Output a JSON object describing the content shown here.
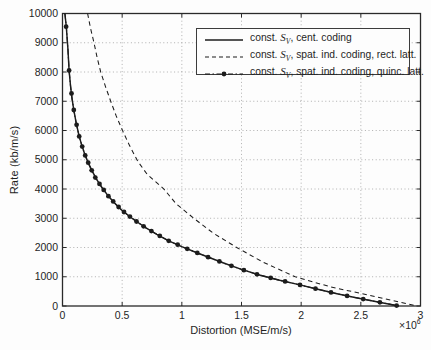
{
  "figure": {
    "background": "#fdfdfd",
    "axis_color": "#2a2a2a",
    "grid_color": "#9c9c9c",
    "text_color": "#1f1f1f",
    "ylabel": "Rate (kb/m/s)",
    "xlabel": "Distortion (MSE/m/s)",
    "x_exponent_prefix": "×10",
    "x_exponent_power": "6"
  },
  "chart_data": {
    "type": "line",
    "title": "",
    "xlabel": "Distortion (MSE/m/s)",
    "ylabel": "Rate (kb/m/s)",
    "xlim": [
      0,
      3
    ],
    "ylim": [
      0,
      10000
    ],
    "x_unit_multiplier": 1000000,
    "x_unit_label": "×10^6",
    "grid": true,
    "grid_style": "dotted",
    "legend_position": "upper-right-inside",
    "x_ticks": [
      0,
      0.5,
      1,
      1.5,
      2,
      2.5,
      3
    ],
    "x_tick_labels": [
      "0",
      "0.5",
      "1",
      "1.5",
      "2",
      "2.5",
      "3"
    ],
    "y_ticks": [
      0,
      1000,
      2000,
      3000,
      4000,
      5000,
      6000,
      7000,
      8000,
      9000,
      10000
    ],
    "y_tick_labels": [
      "0",
      "1000",
      "2000",
      "3000",
      "4000",
      "5000",
      "6000",
      "7000",
      "8000",
      "9000",
      "10000"
    ],
    "series": [
      {
        "name": "const. S_V, cent. coding",
        "line_style": "solid",
        "marker": "none",
        "color": "#1c1c1c",
        "points": [
          [
            0.02,
            10000
          ],
          [
            0.032,
            9550
          ],
          [
            0.045,
            8800
          ],
          [
            0.055,
            8050
          ],
          [
            0.068,
            7500
          ],
          [
            0.08,
            7100
          ],
          [
            0.095,
            6700
          ],
          [
            0.115,
            6250
          ],
          [
            0.14,
            5800
          ],
          [
            0.165,
            5450
          ],
          [
            0.19,
            5150
          ],
          [
            0.22,
            4850
          ],
          [
            0.25,
            4600
          ],
          [
            0.29,
            4300
          ],
          [
            0.33,
            4050
          ],
          [
            0.38,
            3780
          ],
          [
            0.43,
            3550
          ],
          [
            0.49,
            3300
          ],
          [
            0.55,
            3100
          ],
          [
            0.62,
            2890
          ],
          [
            0.7,
            2670
          ],
          [
            0.79,
            2450
          ],
          [
            0.89,
            2230
          ],
          [
            1.0,
            2030
          ],
          [
            1.12,
            1830
          ],
          [
            1.24,
            1640
          ],
          [
            1.35,
            1470
          ],
          [
            1.5,
            1250
          ],
          [
            1.65,
            1060
          ],
          [
            1.82,
            880
          ],
          [
            1.98,
            730
          ],
          [
            2.13,
            580
          ],
          [
            2.3,
            420
          ],
          [
            2.45,
            290
          ],
          [
            2.6,
            170
          ],
          [
            2.72,
            80
          ],
          [
            2.82,
            0
          ]
        ]
      },
      {
        "name": "const. S_V, spat. ind. coding, rect. latt.",
        "line_style": "dashed",
        "marker": "none",
        "color": "#1c1c1c",
        "points": [
          [
            0.21,
            10000
          ],
          [
            0.235,
            9500
          ],
          [
            0.264,
            9000
          ],
          [
            0.29,
            8500
          ],
          [
            0.32,
            8000
          ],
          [
            0.36,
            7500
          ],
          [
            0.404,
            7000
          ],
          [
            0.45,
            6500
          ],
          [
            0.503,
            6000
          ],
          [
            0.56,
            5500
          ],
          [
            0.63,
            4950
          ],
          [
            0.71,
            4500
          ],
          [
            0.85,
            4000
          ],
          [
            0.95,
            3500
          ],
          [
            1.1,
            3000
          ],
          [
            1.26,
            2500
          ],
          [
            1.46,
            2000
          ],
          [
            1.68,
            1500
          ],
          [
            1.95,
            1000
          ],
          [
            2.25,
            650
          ],
          [
            2.5,
            430
          ],
          [
            2.7,
            250
          ],
          [
            2.9,
            70
          ],
          [
            2.97,
            0
          ]
        ]
      },
      {
        "name": "const. S_V, spat. ind. coding, quinc. latt.",
        "line_style": "dash-dot",
        "marker": "filled-circle",
        "color": "#1c1c1c",
        "line_coincides_with": 0,
        "points": [
          [
            0.03,
            9550
          ],
          [
            0.055,
            8050
          ],
          [
            0.075,
            7265
          ],
          [
            0.095,
            6700
          ],
          [
            0.118,
            6195
          ],
          [
            0.14,
            5800
          ],
          [
            0.165,
            5450
          ],
          [
            0.19,
            5150
          ],
          [
            0.215,
            4900
          ],
          [
            0.245,
            4640
          ],
          [
            0.275,
            4390
          ],
          [
            0.31,
            4175
          ],
          [
            0.345,
            3970
          ],
          [
            0.385,
            3755
          ],
          [
            0.425,
            3575
          ],
          [
            0.47,
            3385
          ],
          [
            0.515,
            3215
          ],
          [
            0.565,
            3055
          ],
          [
            0.62,
            2890
          ],
          [
            0.68,
            2725
          ],
          [
            0.745,
            2560
          ],
          [
            0.815,
            2395
          ],
          [
            0.89,
            2230
          ],
          [
            0.965,
            2095
          ],
          [
            1.045,
            1955
          ],
          [
            1.13,
            1815
          ],
          [
            1.22,
            1670
          ],
          [
            1.315,
            1525
          ],
          [
            1.415,
            1375
          ],
          [
            1.52,
            1225
          ],
          [
            1.63,
            1085
          ],
          [
            1.745,
            960
          ],
          [
            1.865,
            840
          ],
          [
            1.99,
            720
          ],
          [
            2.12,
            590
          ],
          [
            2.25,
            465
          ],
          [
            2.385,
            345
          ],
          [
            2.52,
            235
          ],
          [
            2.66,
            125
          ],
          [
            2.8,
            15
          ]
        ]
      }
    ]
  },
  "legend": {
    "items": [
      {
        "prefix": "const. ",
        "var": "S",
        "sub": "V",
        "suffix": ", cent. coding",
        "dash": "none",
        "marker": false
      },
      {
        "prefix": "const. ",
        "var": "S",
        "sub": "V",
        "suffix": ", spat. ind. coding, rect. latt.",
        "dash": "4 3",
        "marker": false
      },
      {
        "prefix": "const. ",
        "var": "S",
        "sub": "V",
        "suffix": ", spat. ind. coding, quinc. latt.",
        "dash": "5 2.5 1.5 2.5",
        "marker": true
      }
    ]
  }
}
